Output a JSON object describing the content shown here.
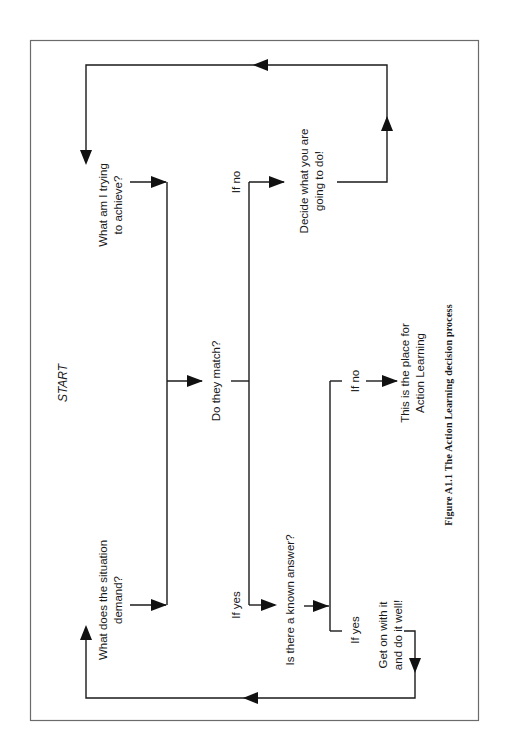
{
  "figure": {
    "caption": "Figure A1.1  The Action Learning decision process",
    "orientation": "rotated 90° counter-clockwise (landscape on portrait page)"
  },
  "nodes": {
    "start": "START",
    "what_trying_1": "What am I trying",
    "what_trying_2": "to achieve?",
    "situation_1": "What does the situation",
    "situation_2": "demand?",
    "do_they_match": "Do they match?",
    "if_no_top": "If no",
    "decide_1": "Decide what you are",
    "decide_2": "going to do!",
    "if_yes_left": "If yes",
    "known_answer": "Is there a known answer?",
    "if_no_right": "If no",
    "action_learning_1": "This is the place for",
    "action_learning_2": "Action Learning",
    "if_yes_right": "If yes",
    "get_on_1": "Get on with it",
    "get_on_2": "and do it well!"
  },
  "edges": [
    {
      "from": "What am I trying to achieve?",
      "to": "Do they match?"
    },
    {
      "from": "What does the situation demand?",
      "to": "Do they match?"
    },
    {
      "from": "Do they match?",
      "to": "Decide what you are going to do!",
      "label": "If no"
    },
    {
      "from": "Do they match?",
      "to": "Is there a known answer?",
      "label": "If yes"
    },
    {
      "from": "Decide what you are going to do!",
      "to": "What am I trying to achieve?",
      "label": "loop back"
    },
    {
      "from": "Is there a known answer?",
      "to": "This is the place for Action Learning",
      "label": "If no"
    },
    {
      "from": "Is there a known answer?",
      "to": "Get on with it and do it well!",
      "label": "If yes"
    },
    {
      "from": "Get on with it and do it well!",
      "to": "What does the situation demand?",
      "label": "loop back"
    }
  ],
  "colors": {
    "line": "#1a1a1a",
    "frame": "#6b6b6b",
    "background": "#ffffff"
  }
}
